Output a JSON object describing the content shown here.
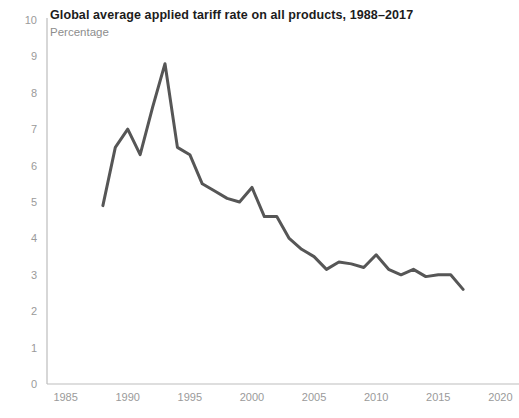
{
  "chart_data": {
    "type": "line",
    "title": "Global average applied tariff rate on all products, 1988–2017",
    "subtitle": "Percentage",
    "xlabel": "",
    "ylabel": "",
    "xlim": [
      1983.5,
      2021.5
    ],
    "ylim": [
      0,
      10
    ],
    "xticks": [
      1985,
      1990,
      1995,
      2000,
      2005,
      2010,
      2015,
      2020
    ],
    "xtick_labels": [
      "1985",
      "1990",
      "1995",
      "2000",
      "2005",
      "2010",
      "2015",
      "2020"
    ],
    "yticks": [
      0,
      1,
      2,
      3,
      4,
      5,
      6,
      7,
      8,
      9,
      10
    ],
    "ytick_labels": [
      "0",
      "1",
      "2",
      "3",
      "4",
      "5",
      "6",
      "7",
      "8",
      "9",
      "10"
    ],
    "grid": false,
    "legend": "none",
    "line_color": "#565656",
    "axis_color": "#bdbdbd",
    "tick_text_color": "#9a9a9a",
    "title_color": "#1c1c1c",
    "subtitle_color": "#8d8d8d",
    "x": [
      1988,
      1989,
      1990,
      1991,
      1992,
      1993,
      1994,
      1995,
      1996,
      1997,
      1998,
      1999,
      2000,
      2001,
      2002,
      2003,
      2004,
      2005,
      2006,
      2007,
      2008,
      2009,
      2010,
      2011,
      2012,
      2013,
      2014,
      2015,
      2016,
      2017
    ],
    "values": [
      4.9,
      6.5,
      7.0,
      6.3,
      7.6,
      8.8,
      6.5,
      6.3,
      5.5,
      5.3,
      5.1,
      5.0,
      5.4,
      4.6,
      4.6,
      4.0,
      3.7,
      3.5,
      3.15,
      3.35,
      3.3,
      3.2,
      3.55,
      3.15,
      3.0,
      3.15,
      2.95,
      3.0,
      3.0,
      2.6
    ],
    "series": [
      {
        "name": "Global average applied tariff rate",
        "values": [
          4.9,
          6.5,
          7.0,
          6.3,
          7.6,
          8.8,
          6.5,
          6.3,
          5.5,
          5.3,
          5.1,
          5.0,
          5.4,
          4.6,
          4.6,
          4.0,
          3.7,
          3.5,
          3.15,
          3.35,
          3.3,
          3.2,
          3.55,
          3.15,
          3.0,
          3.15,
          2.95,
          3.0,
          3.0,
          2.6
        ]
      }
    ]
  },
  "plot_geometry": {
    "left": 47,
    "right": 519,
    "top": 20,
    "bottom": 384
  }
}
